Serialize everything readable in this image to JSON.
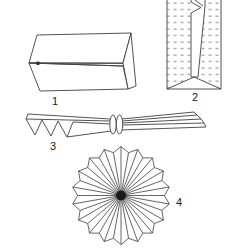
{
  "figure": {
    "background_color": "#ffffff",
    "line_color": "#3f3f3f",
    "dot_color": "#9e9e9e",
    "center_color": "#1a1a1a",
    "steps": [
      {
        "label": "1",
        "name": "flattened paper bag"
      },
      {
        "label": "2",
        "name": "dotted paper bag with notch"
      },
      {
        "label": "3",
        "name": "pleated fan tied in middle"
      },
      {
        "label": "4",
        "name": "opened circular rosette"
      }
    ]
  }
}
